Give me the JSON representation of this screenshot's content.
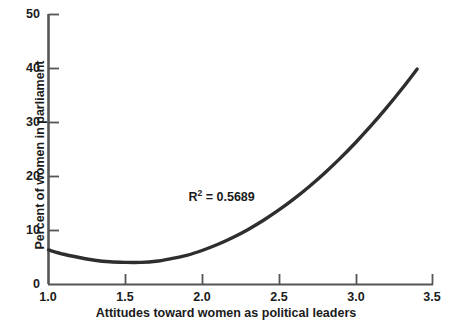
{
  "chart_data": {
    "type": "line",
    "title": "",
    "subtitle": "",
    "xlabel": "Attitudes toward women as political leaders",
    "ylabel": "Percent of women in parliament",
    "xlim": [
      1.0,
      3.5
    ],
    "ylim": [
      0,
      50
    ],
    "grid": false,
    "legend": null,
    "xticks": [
      1.0,
      1.5,
      2.0,
      2.5,
      3.0,
      3.5
    ],
    "xtick_labels": [
      "1.0",
      "1.5",
      "2.0",
      "2.5",
      "3.0",
      "3.5"
    ],
    "yticks": [
      0,
      10,
      20,
      30,
      40,
      50
    ],
    "ytick_labels": [
      "0",
      "10",
      "20",
      "30",
      "40",
      "50"
    ],
    "annotations": [
      {
        "name": "r-squared",
        "base_text": "R",
        "exponent": "2",
        "tail_text": " = 0.5689",
        "value": 0.5689,
        "x": 2.25,
        "y": 16.0
      }
    ],
    "series": [
      {
        "name": "Quadratic fit",
        "kind": "curve",
        "color": "#2e2e2e",
        "line_width": 3.4,
        "x": [
          1.0,
          1.1,
          1.2,
          1.3,
          1.4,
          1.5,
          1.6,
          1.7,
          1.8,
          1.9,
          2.0,
          2.1,
          2.2,
          2.3,
          2.4,
          2.5,
          2.6,
          2.7,
          2.8,
          2.9,
          3.0,
          3.1,
          3.2,
          3.3,
          3.4,
          3.47
        ],
        "values": [
          6.4,
          5.6,
          5.0,
          4.5,
          4.2,
          4.1,
          4.1,
          4.3,
          4.8,
          5.4,
          6.3,
          7.4,
          8.7,
          10.2,
          11.9,
          13.8,
          15.9,
          18.2,
          20.7,
          23.4,
          26.3,
          29.4,
          32.7,
          36.2,
          39.9,
          38.8
        ]
      }
    ]
  },
  "axes": {
    "x_axis_name": "x-axis",
    "y_axis_name": "y-axis"
  },
  "colors": {
    "curve": "#2e2e2e",
    "axis": "#555555",
    "text": "#1b1b1b",
    "background": "#ffffff"
  }
}
